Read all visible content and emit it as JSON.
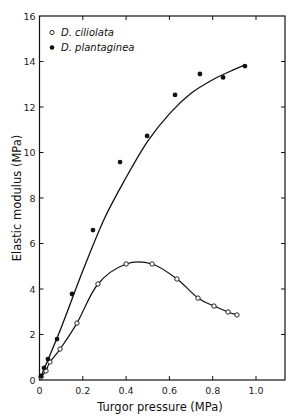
{
  "chart_data": {
    "type": "scatter",
    "title": "",
    "xlabel": "Turgor pressure (MPa)",
    "ylabel": "Elastic modulus (MPa)",
    "xlim": [
      0,
      1.1
    ],
    "ylim": [
      0,
      16
    ],
    "x_ticks": [
      0,
      0.2,
      0.4,
      0.6,
      0.8,
      1.0
    ],
    "x_tick_labels": [
      "0",
      "0.2",
      "0.4",
      "0.6",
      "0.8",
      "1.0"
    ],
    "y_ticks": [
      0,
      2,
      4,
      6,
      8,
      10,
      12,
      14,
      16
    ],
    "y_tick_labels": [
      "0",
      "2",
      "4",
      "6",
      "8",
      "10",
      "12",
      "14",
      "16"
    ],
    "grid": false,
    "legend_position": "upper-left",
    "series": [
      {
        "name": "D. ciliolata",
        "marker": "open-circle",
        "curve": "smoothed line through points (rises, peaks ~5.1 near 0.45, then declines)",
        "x": [
          0.007,
          0.03,
          0.048,
          0.095,
          0.173,
          0.27,
          0.4,
          0.52,
          0.635,
          0.732,
          0.806,
          0.871,
          0.912
        ],
        "y": [
          0.13,
          0.4,
          0.79,
          1.36,
          2.5,
          4.22,
          5.1,
          5.1,
          4.44,
          3.6,
          3.25,
          2.99,
          2.86
        ]
      },
      {
        "name": "D. plantaginea",
        "marker": "filled-circle",
        "curve": "smooth fitted curve (nearly linear at low pressure, saturating ~13.8)",
        "x": [
          0.007,
          0.021,
          0.039,
          0.081,
          0.15,
          0.247,
          0.372,
          0.497,
          0.626,
          0.741,
          0.848,
          0.949
        ],
        "y": [
          0.18,
          0.53,
          0.92,
          1.8,
          3.78,
          6.59,
          9.58,
          10.73,
          12.53,
          13.45,
          13.3,
          13.8
        ]
      }
    ],
    "fit_curve_plantaginea": {
      "x": [
        0,
        0.1,
        0.2,
        0.3,
        0.4,
        0.5,
        0.6,
        0.7,
        0.8,
        0.9,
        0.95
      ],
      "y": [
        0,
        2.3,
        4.8,
        7.1,
        8.9,
        10.5,
        11.7,
        12.6,
        13.2,
        13.65,
        13.85
      ]
    }
  },
  "legend": {
    "items": [
      {
        "label": "D. ciliolata",
        "marker": "open-circle"
      },
      {
        "label": "D. plantaginea",
        "marker": "filled-circle"
      }
    ]
  },
  "axes": {
    "xlabel": "Turgor pressure (MPa)",
    "ylabel": "Elastic modulus (MPa)"
  },
  "colors": {
    "ink": "#111111",
    "background": "#ffffff"
  }
}
